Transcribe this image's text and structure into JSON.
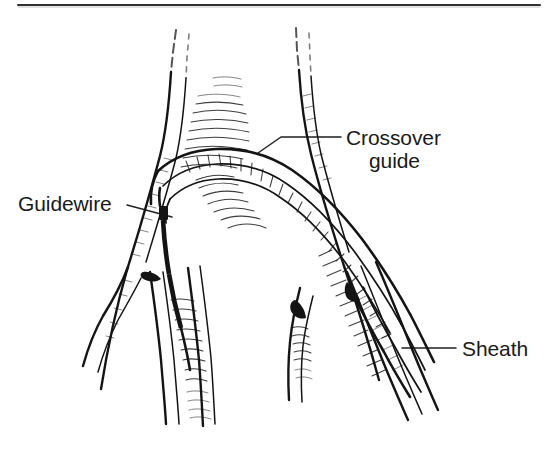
{
  "figure": {
    "kind": "medical-line-illustration",
    "background_color": "#ffffff",
    "ink_color": "#141414",
    "text_color": "#1a1a1a",
    "width": 545,
    "height": 450
  },
  "top_rule": {
    "present": true,
    "x1": 18,
    "x2": 540,
    "y": 5
  },
  "labels": [
    {
      "id": "crossover-guide",
      "text_line1": "Crossover",
      "text_line2": "guide",
      "x": 346,
      "y1": 145,
      "y2": 168,
      "anchor": "start",
      "leader": {
        "type": "elbow",
        "points": "258,153 281,137 341,137"
      }
    },
    {
      "id": "guidewire",
      "text_line1": "Guidewire",
      "text_line2": "",
      "x": 18,
      "y1": 211,
      "y2": 0,
      "anchor": "start",
      "leader": {
        "type": "straight",
        "points": "127,205 172,217"
      }
    },
    {
      "id": "sheath",
      "text_line1": "Sheath",
      "text_line2": "",
      "x": 462,
      "y1": 356,
      "y2": 0,
      "anchor": "start",
      "leader": {
        "type": "straight",
        "points": "402,348 456,348"
      }
    }
  ],
  "anatomy": {
    "aorta_label": "abdominal aorta",
    "left_iliac_label": "left common iliac artery",
    "right_iliac_label": "right common iliac artery",
    "bifurcation_apex": {
      "x": 243,
      "y": 196
    }
  },
  "devices": {
    "crossover_guide_catheter": "arches over the aortic bifurcation from right to left",
    "guidewire": "dark wire descending into the left common iliac artery",
    "guidewire_marker": {
      "x": 159,
      "y": 206,
      "w": 9,
      "h": 14
    },
    "sheath": "introducer sheath in the right common iliac artery"
  }
}
